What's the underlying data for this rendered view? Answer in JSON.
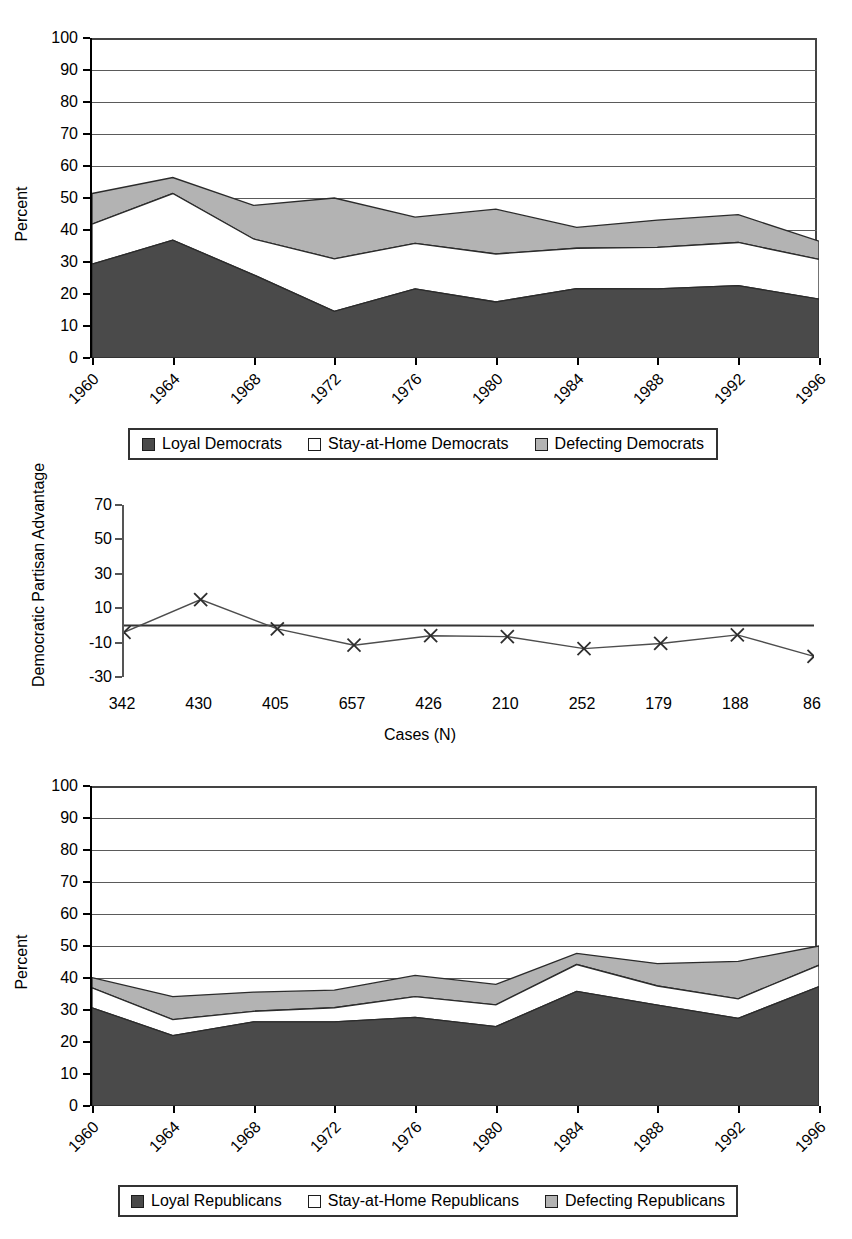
{
  "colors": {
    "loyal": "#4a4a4a",
    "stay_home": "#ffffff",
    "defecting": "#b3b3b3",
    "axis": "#000000",
    "grid": "#5a5a5a",
    "line": "#4d4d4d"
  },
  "top_fragment": {
    "text": ""
  },
  "chart_data": [
    {
      "id": "democrats",
      "type": "area",
      "stacked": true,
      "title": "",
      "xlabel": "",
      "ylabel": "Percent",
      "ylim": [
        0,
        100
      ],
      "ytick_step": 10,
      "grid": true,
      "legend_position": "bottom",
      "categories": [
        "1960",
        "1964",
        "1968",
        "1972",
        "1976",
        "1980",
        "1984",
        "1988",
        "1992",
        "1996"
      ],
      "yticks": [
        "100",
        "90",
        "80",
        "70",
        "60",
        "50",
        "40",
        "30",
        "20",
        "10",
        "0"
      ],
      "series": [
        {
          "name": "Loyal Democrats",
          "swatch": "#4a4a4a",
          "values": [
            29.3,
            36.8,
            26.0,
            14.6,
            21.6,
            17.5,
            21.7,
            21.6,
            22.6,
            18.4
          ]
        },
        {
          "name": "Stay-at-Home Democrats",
          "swatch": "#ffffff",
          "values": [
            12.5,
            14.6,
            11.2,
            16.4,
            14.2,
            15.0,
            12.6,
            13.0,
            13.5,
            12.4
          ]
        },
        {
          "name": "Defecting Democrats",
          "swatch": "#b3b3b3",
          "values": [
            9.6,
            5.0,
            10.5,
            19.0,
            8.2,
            14.0,
            6.5,
            8.5,
            8.7,
            5.7
          ]
        }
      ],
      "cumulative": [
        {
          "name": "Loyal Democrats",
          "values": [
            29.3,
            36.8,
            26.0,
            14.6,
            21.6,
            17.5,
            21.7,
            21.6,
            22.6,
            18.4
          ]
        },
        {
          "name": "Loyal + Stay-at-Home",
          "values": [
            41.8,
            51.4,
            37.2,
            31.0,
            35.8,
            32.5,
            34.3,
            34.6,
            36.1,
            30.8
          ]
        },
        {
          "name": "Total Democrats",
          "values": [
            51.4,
            56.4,
            47.7,
            50.0,
            44.0,
            46.5,
            40.8,
            43.1,
            44.8,
            36.5
          ]
        }
      ]
    },
    {
      "id": "partisan-advantage",
      "type": "line",
      "title": "",
      "xlabel": "Cases (N)",
      "ylabel": "Democratic Partisan Advantage",
      "ylim": [
        -30,
        70
      ],
      "ytick_step": 20,
      "grid": false,
      "marker": "x",
      "yticks": [
        "70",
        "50",
        "30",
        "10",
        "-10",
        "-30"
      ],
      "categories": [
        "342",
        "430",
        "405",
        "657",
        "426",
        "210",
        "252",
        "179",
        "188",
        "86"
      ],
      "values": [
        -4.0,
        15.0,
        -2.0,
        -11.5,
        -6.0,
        -6.5,
        -13.5,
        -10.5,
        -5.5,
        -18.0
      ],
      "zero_line": 0
    },
    {
      "id": "republicans",
      "type": "area",
      "stacked": true,
      "title": "",
      "xlabel": "",
      "ylabel": "Percent",
      "ylim": [
        0,
        100
      ],
      "ytick_step": 10,
      "grid": true,
      "legend_position": "bottom",
      "categories": [
        "1960",
        "1964",
        "1968",
        "1972",
        "1976",
        "1980",
        "1984",
        "1988",
        "1992",
        "1996"
      ],
      "yticks": [
        "100",
        "90",
        "80",
        "70",
        "60",
        "50",
        "40",
        "30",
        "20",
        "10",
        "0"
      ],
      "series": [
        {
          "name": "Loyal Republicans",
          "swatch": "#4a4a4a",
          "values": [
            30.7,
            22.0,
            26.3,
            26.3,
            27.7,
            24.8,
            35.8,
            31.5,
            27.4,
            37.3
          ]
        },
        {
          "name": "Stay-at-Home Republicans",
          "swatch": "#ffffff",
          "values": [
            6.2,
            5.0,
            3.3,
            4.4,
            6.5,
            6.8,
            8.4,
            6.0,
            6.1,
            6.7
          ]
        },
        {
          "name": "Defecting Republicans",
          "swatch": "#b3b3b3",
          "values": [
            3.2,
            7.2,
            6.0,
            5.5,
            6.6,
            6.4,
            3.5,
            7.0,
            11.7,
            6.0
          ]
        }
      ],
      "cumulative": [
        {
          "name": "Loyal Republicans",
          "values": [
            30.7,
            22.0,
            26.3,
            26.3,
            27.7,
            24.8,
            35.8,
            31.5,
            27.4,
            37.3
          ]
        },
        {
          "name": "Loyal + Stay-at-Home",
          "values": [
            36.9,
            27.0,
            29.6,
            30.7,
            34.2,
            31.6,
            44.2,
            37.5,
            33.5,
            44.0
          ]
        },
        {
          "name": "Total Republicans",
          "values": [
            40.1,
            34.2,
            35.6,
            36.2,
            40.8,
            38.0,
            47.7,
            44.5,
            45.2,
            50.0
          ]
        }
      ]
    }
  ],
  "legends": {
    "democrats": {
      "items": [
        {
          "label": "Loyal Democrats",
          "color": "#4a4a4a"
        },
        {
          "label": "Stay-at-Home Democrats",
          "color": "#ffffff"
        },
        {
          "label": "Defecting Democrats",
          "color": "#b3b3b3"
        }
      ]
    },
    "republicans": {
      "items": [
        {
          "label": "Loyal Republicans",
          "color": "#4a4a4a"
        },
        {
          "label": "Stay-at-Home Republicans",
          "color": "#ffffff"
        },
        {
          "label": "Defecting Republicans",
          "color": "#b3b3b3"
        }
      ]
    }
  }
}
